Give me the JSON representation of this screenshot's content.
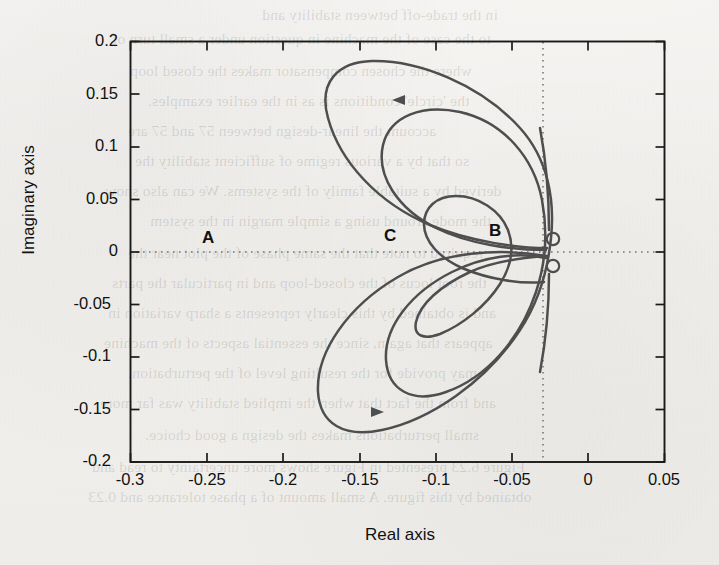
{
  "figure": {
    "kind": "nyquist-plot",
    "background": "#f1f0ed",
    "curve_color": "#4a4a4a",
    "axis_color": "#1a1a1a",
    "frame": {
      "left": 130,
      "top": 41,
      "right": 665,
      "bottom": 462
    }
  },
  "axes": {
    "xlabel": "Real axis",
    "ylabel": "Imaginary axis",
    "xticks": [
      "-0.3",
      "-0.25",
      "-0.2",
      "-0.15",
      "-0.1",
      "-0.05",
      "0",
      "0.05"
    ],
    "xtick_values": [
      -0.3,
      -0.25,
      -0.2,
      -0.15,
      -0.1,
      -0.05,
      0,
      0.05
    ],
    "yticks": [
      "0.2",
      "0.15",
      "0.1",
      "0.05",
      "0",
      "-0.05",
      "-0.1",
      "-0.15",
      "-0.2"
    ],
    "ytick_values": [
      0.2,
      0.15,
      0.1,
      0.05,
      0,
      -0.05,
      -0.1,
      -0.15,
      -0.2
    ],
    "xlim": [
      -0.3,
      0.05
    ],
    "ylim": [
      -0.2,
      0.2
    ],
    "grid": false,
    "zero_lines": true
  },
  "annotations": [
    {
      "text": "A",
      "x": -0.245,
      "y": 0.012
    },
    {
      "text": "B",
      "x": -0.043,
      "y": 0.018
    },
    {
      "text": "C",
      "x": -0.112,
      "y": 0.014
    }
  ],
  "arrows": [
    {
      "x": -0.128,
      "y": 0.1445,
      "direction": "left"
    },
    {
      "x": -0.14,
      "y": -0.1455,
      "direction": "right"
    }
  ],
  "bleed_text": [
    {
      "t": "in the trade-off between stability and",
      "x": 262,
      "y": 6
    },
    {
      "t": "to the case of the machine in question under a small turn of",
      "x": 112,
      "y": 30
    },
    {
      "t": "where the chosen compensator makes the closed loop",
      "x": 130,
      "y": 62
    },
    {
      "t": "the 'circle' conditions is as in the earlier examples.",
      "x": 148,
      "y": 92
    },
    {
      "t": "account the linear-design between 57 and 57 are",
      "x": 128,
      "y": 122
    },
    {
      "t": "so that by a various regime of sufficient stability the",
      "x": 135,
      "y": 152
    },
    {
      "t": "derived by a suitable family of the systems. We can also show",
      "x": 105,
      "y": 182
    },
    {
      "t": "the mode around using a simple margin in the system",
      "x": 150,
      "y": 212
    },
    {
      "t": "required to note that the same phase of the plot near the",
      "x": 128,
      "y": 244
    },
    {
      "t": "the root locus of the closed-loop and in particular the parts",
      "x": 112,
      "y": 274
    },
    {
      "t": "and is obtained by this clearly represents a sharp variation in",
      "x": 108,
      "y": 304
    },
    {
      "t": "appears that again, since the essential aspects of the machine",
      "x": 104,
      "y": 334
    },
    {
      "t": "may provide for the resulting level of the perturbation,",
      "x": 128,
      "y": 364
    },
    {
      "t": "and from the fact that when the implied stability was far more",
      "x": 100,
      "y": 394
    },
    {
      "t": "small perturbations makes the design a good choice.",
      "x": 145,
      "y": 426
    },
    {
      "t": "Figure 6.23 presented in Figure shows more uncertainty to read and",
      "x": 92,
      "y": 458
    },
    {
      "t": "obtained by this figure. A small amount of a phase tolerance and 0.23",
      "x": 88,
      "y": 488
    }
  ]
}
